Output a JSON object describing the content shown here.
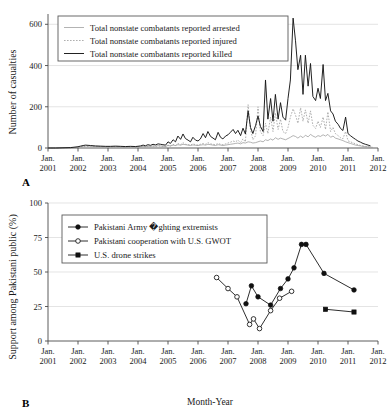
{
  "figure": {
    "panels": [
      {
        "label": "A",
        "ylabel": "Number of casualties",
        "xlabel": "",
        "yticks": [
          "0",
          "200",
          "400",
          "600"
        ],
        "xticks_month": [
          "Jan.",
          "Jan.",
          "Jan.",
          "Jan.",
          "Jan.",
          "Jan.",
          "Jan.",
          "Jan.",
          "Jan.",
          "Jan.",
          "Jan.",
          "Jan."
        ],
        "xticks_year": [
          "2001",
          "2002",
          "2003",
          "2004",
          "2005",
          "2006",
          "2007",
          "2008",
          "2009",
          "2010",
          "2011",
          "2012"
        ],
        "legend": [
          {
            "label": "Total nonstate combatants reported arrested",
            "style": "solid-gray"
          },
          {
            "label": "Total nonstate combatants reported injured",
            "style": "dotted-gray"
          },
          {
            "label": "Total nonstate combatants reported killed",
            "style": "solid-black"
          }
        ]
      },
      {
        "label": "B",
        "ylabel": "Support among Pakistani public (%)",
        "xlabel": "Month-Year",
        "yticks": [
          "0",
          "25",
          "50",
          "75",
          "100"
        ],
        "xticks_month": [
          "Jan.",
          "Jan.",
          "Jan.",
          "Jan.",
          "Jan.",
          "Jan.",
          "Jan.",
          "Jan.",
          "Jan.",
          "Jan.",
          "Jan.",
          "Jan."
        ],
        "xticks_year": [
          "2001",
          "2002",
          "2003",
          "2004",
          "2005",
          "2006",
          "2007",
          "2008",
          "2009",
          "2010",
          "2011",
          "2012"
        ],
        "legend": [
          {
            "label": "Pakistani Army �ghting extremists",
            "style": "line-filled-circle"
          },
          {
            "label": "Pakistani cooperation with U.S. GWOT",
            "style": "line-open-circle"
          },
          {
            "label": "U.S. drone strikes",
            "style": "line-filled-square"
          }
        ]
      }
    ]
  },
  "chart_data": [
    {
      "type": "line",
      "panel": "A",
      "title": "",
      "xlabel": "",
      "ylabel": "Number of casualties",
      "ylim": [
        0,
        650
      ],
      "xlim": [
        2001.0,
        2012.0
      ],
      "grid": true,
      "legend_position": "top-left",
      "x": [
        2001.0,
        2001.25,
        2001.5,
        2001.75,
        2002.0,
        2002.08,
        2002.17,
        2002.25,
        2002.42,
        2002.58,
        2002.75,
        2002.92,
        2003.08,
        2003.25,
        2003.42,
        2003.58,
        2003.75,
        2003.92,
        2004.08,
        2004.17,
        2004.25,
        2004.33,
        2004.42,
        2004.5,
        2004.58,
        2004.67,
        2004.75,
        2004.83,
        2004.92,
        2005.0,
        2005.08,
        2005.17,
        2005.25,
        2005.33,
        2005.42,
        2005.5,
        2005.58,
        2005.67,
        2005.75,
        2005.83,
        2005.92,
        2006.0,
        2006.08,
        2006.17,
        2006.25,
        2006.33,
        2006.42,
        2006.5,
        2006.58,
        2006.67,
        2006.75,
        2006.83,
        2006.92,
        2007.0,
        2007.08,
        2007.17,
        2007.25,
        2007.33,
        2007.42,
        2007.5,
        2007.58,
        2007.67,
        2007.75,
        2007.83,
        2007.92,
        2008.0,
        2008.08,
        2008.17,
        2008.25,
        2008.33,
        2008.42,
        2008.5,
        2008.58,
        2008.67,
        2008.75,
        2008.83,
        2008.92,
        2009.0,
        2009.08,
        2009.17,
        2009.25,
        2009.33,
        2009.42,
        2009.5,
        2009.58,
        2009.67,
        2009.75,
        2009.83,
        2009.92,
        2010.0,
        2010.08,
        2010.17,
        2010.25,
        2010.33,
        2010.42,
        2010.5,
        2010.58,
        2010.67,
        2010.75,
        2010.83,
        2010.92,
        2011.0,
        2011.08,
        2011.17,
        2011.25,
        2011.33,
        2011.42,
        2011.5,
        2011.58,
        2011.67,
        2011.75,
        2011.83,
        2011.92
      ],
      "series": [
        {
          "name": "Total nonstate combatants reported arrested",
          "style": "solid-gray",
          "values": [
            0,
            0,
            0,
            1,
            4,
            6,
            8,
            10,
            9,
            8,
            7,
            6,
            6,
            7,
            6,
            5,
            6,
            5,
            6,
            8,
            7,
            9,
            8,
            10,
            9,
            11,
            10,
            9,
            8,
            12,
            10,
            14,
            12,
            16,
            14,
            18,
            16,
            14,
            12,
            15,
            13,
            12,
            14,
            16,
            14,
            18,
            16,
            14,
            12,
            16,
            14,
            12,
            14,
            16,
            18,
            20,
            22,
            24,
            20,
            26,
            24,
            30,
            28,
            24,
            26,
            30,
            34,
            30,
            40,
            36,
            44,
            38,
            50,
            42,
            48,
            44,
            40,
            46,
            52,
            60,
            56,
            48,
            58,
            50,
            62,
            54,
            66,
            58,
            52,
            60,
            56,
            64,
            58,
            66,
            52,
            58,
            48,
            44,
            40,
            36,
            30,
            26,
            22,
            18,
            14,
            12,
            10,
            8,
            6,
            5,
            4,
            3
          ]
        },
        {
          "name": "Total nonstate combatants reported injured",
          "style": "dotted-gray",
          "values": [
            0,
            0,
            0,
            1,
            3,
            5,
            6,
            8,
            7,
            6,
            6,
            5,
            5,
            6,
            5,
            4,
            5,
            4,
            6,
            8,
            6,
            8,
            7,
            9,
            8,
            10,
            9,
            8,
            7,
            14,
            10,
            18,
            12,
            22,
            16,
            26,
            18,
            16,
            14,
            20,
            16,
            14,
            18,
            22,
            18,
            26,
            20,
            18,
            16,
            22,
            18,
            16,
            20,
            24,
            28,
            34,
            30,
            38,
            26,
            44,
            30,
            210,
            90,
            40,
            60,
            200,
            80,
            60,
            120,
            70,
            150,
            80,
            170,
            90,
            140,
            80,
            70,
            100,
            150,
            190,
            160,
            120,
            195,
            130,
            185,
            120,
            180,
            110,
            95,
            130,
            100,
            150,
            90,
            175,
            80,
            100,
            70,
            60,
            50,
            45,
            80,
            35,
            30,
            25,
            20,
            16,
            12,
            10,
            8,
            6,
            4
          ]
        },
        {
          "name": "Total nonstate combatants reported killed",
          "style": "solid-black",
          "values": [
            0,
            0,
            1,
            2,
            6,
            9,
            12,
            14,
            12,
            10,
            9,
            8,
            8,
            9,
            8,
            7,
            8,
            7,
            10,
            14,
            11,
            16,
            13,
            18,
            15,
            20,
            18,
            16,
            14,
            30,
            22,
            40,
            30,
            58,
            42,
            68,
            46,
            38,
            30,
            52,
            38,
            34,
            44,
            70,
            50,
            80,
            56,
            48,
            40,
            76,
            52,
            44,
            58,
            64,
            76,
            90,
            70,
            86,
            60,
            96,
            68,
            180,
            100,
            70,
            110,
            155,
            105,
            80,
            330,
            140,
            240,
            130,
            260,
            140,
            220,
            150,
            135,
            240,
            330,
            630,
            520,
            380,
            450,
            260,
            450,
            300,
            410,
            250,
            230,
            290,
            240,
            405,
            230,
            265,
            180,
            165,
            130,
            115,
            95,
            85,
            150,
            70,
            60,
            50,
            42,
            34,
            28,
            22,
            18,
            14,
            10
          ]
        }
      ]
    },
    {
      "type": "line",
      "panel": "B",
      "title": "",
      "xlabel": "Month-Year",
      "ylabel": "Support among Pakistani public (%)",
      "ylim": [
        0,
        100
      ],
      "xlim": [
        2001.0,
        2012.0
      ],
      "grid": true,
      "legend_position": "top-left",
      "series": [
        {
          "name": "Pakistani Army �ghting extremists",
          "style": "line-filled-circle",
          "marker": "filled-circle",
          "x": [
            2007.6,
            2007.78,
            2008.0,
            2008.42,
            2008.75,
            2009.0,
            2009.2,
            2009.45,
            2009.6,
            2010.2,
            2011.2
          ],
          "values": [
            27,
            40,
            32,
            26,
            38,
            45,
            53,
            70,
            70,
            49,
            37
          ]
        },
        {
          "name": "Pakistani cooperation with U.S. GWOT",
          "style": "line-open-circle",
          "marker": "open-circle",
          "x": [
            2006.62,
            2007.0,
            2007.3,
            2007.72,
            2007.85,
            2008.05,
            2008.42,
            2008.72,
            2009.12
          ],
          "values": [
            46,
            38,
            32,
            12,
            16,
            9,
            22,
            31,
            36
          ]
        },
        {
          "name": "U.S. drone strikes",
          "style": "line-filled-square",
          "marker": "filled-square",
          "x": [
            2010.25,
            2011.2
          ],
          "values": [
            23,
            21
          ]
        }
      ]
    }
  ]
}
